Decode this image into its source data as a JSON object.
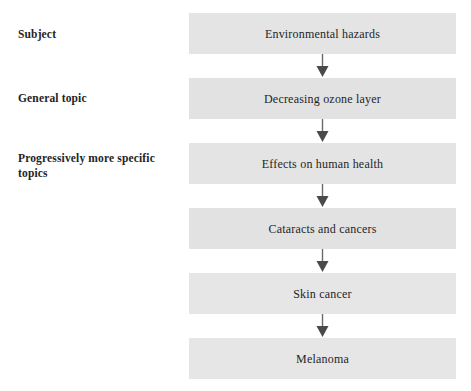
{
  "figure": {
    "type": "vertical-flow-chart",
    "orientation": "top-to-bottom",
    "box_fill_color": "#e4e4e4",
    "text_color": "#1f1f1f",
    "background_color": "#ffffff",
    "arrow_color": "#555555"
  },
  "stage_labels": [
    {
      "id": "subject",
      "text": "Subject"
    },
    {
      "id": "general-topic",
      "text": "General topic"
    },
    {
      "id": "specific-topics",
      "text": "Progressively more specific topics"
    }
  ],
  "flow": {
    "nodes": [
      {
        "id": "node-1",
        "label": "Environmental hazards"
      },
      {
        "id": "node-2",
        "label": "Decreasing ozone layer"
      },
      {
        "id": "node-3",
        "label": "Effects on human health"
      },
      {
        "id": "node-4",
        "label": "Cataracts and cancers"
      },
      {
        "id": "node-5",
        "label": "Skin cancer"
      },
      {
        "id": "node-6",
        "label": "Melanoma"
      }
    ],
    "connectors": [
      {
        "id": "arrow-1",
        "from": "node-1",
        "to": "node-2",
        "icon": "arrow-down-icon"
      },
      {
        "id": "arrow-2",
        "from": "node-2",
        "to": "node-3",
        "icon": "arrow-down-icon"
      },
      {
        "id": "arrow-3",
        "from": "node-3",
        "to": "node-4",
        "icon": "arrow-down-icon"
      },
      {
        "id": "arrow-4",
        "from": "node-4",
        "to": "node-5",
        "icon": "arrow-down-icon"
      },
      {
        "id": "arrow-5",
        "from": "node-5",
        "to": "node-6",
        "icon": "arrow-down-icon"
      }
    ]
  }
}
